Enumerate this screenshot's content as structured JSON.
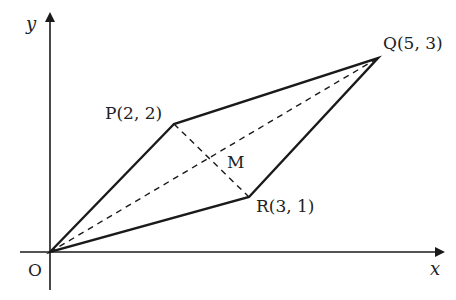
{
  "diagram": {
    "type": "coordinate-geometry",
    "axes": {
      "x_label": "x",
      "y_label": "y",
      "origin_label": "O"
    },
    "points": {
      "O": {
        "label": "O",
        "coords": [
          0,
          0
        ]
      },
      "P": {
        "label": "P(2, 2)",
        "coords": [
          2,
          2
        ]
      },
      "Q": {
        "label": "Q(5, 3)",
        "coords": [
          5,
          3
        ]
      },
      "R": {
        "label": "R(3, 1)",
        "coords": [
          3,
          1
        ]
      },
      "M": {
        "label": "M"
      }
    },
    "edges": [
      {
        "from": "O",
        "to": "P",
        "style": "solid"
      },
      {
        "from": "P",
        "to": "Q",
        "style": "solid"
      },
      {
        "from": "Q",
        "to": "R",
        "style": "solid"
      },
      {
        "from": "R",
        "to": "O",
        "style": "solid"
      },
      {
        "from": "O",
        "to": "Q",
        "style": "dashed"
      },
      {
        "from": "P",
        "to": "R",
        "style": "dashed"
      }
    ],
    "colors": {
      "stroke": "#1a1a1a",
      "text": "#222222",
      "background": "#ffffff"
    }
  }
}
